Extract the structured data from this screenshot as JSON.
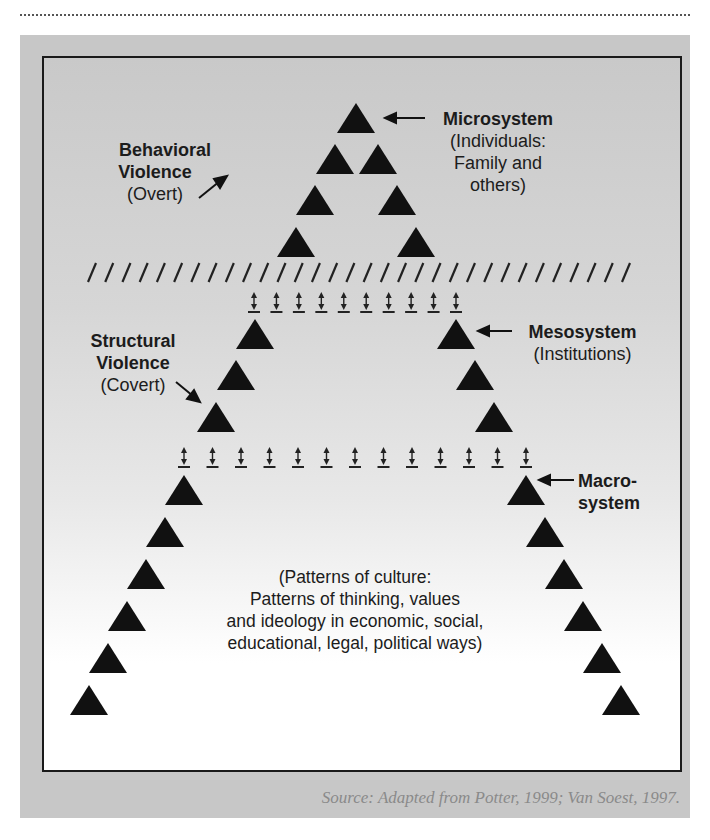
{
  "figure": {
    "labels": {
      "microsystem": {
        "title": "Microsystem",
        "lines": [
          "(Individuals:",
          "Family and",
          "others)"
        ]
      },
      "behavioral": {
        "title_1": "Behavioral",
        "title_2": "Violence",
        "sub": "(Overt)"
      },
      "mesosystem": {
        "title": "Mesosystem",
        "sub": "(Institutions)"
      },
      "structural": {
        "title_1": "Structural",
        "title_2": "Violence",
        "sub": "(Covert)"
      },
      "macrosystem": {
        "title_1": "Macro-",
        "title_2": "system"
      },
      "culture": {
        "lines": [
          "(Patterns of culture:",
          "Patterns of thinking, values",
          "and ideology in economic, social,",
          "educational, legal, political ways)"
        ]
      }
    },
    "source": "Source: Adapted from Potter, 1999; Van Soest, 1997.",
    "structure": {
      "micro_triangle_count": 7,
      "slash_divider_count": 32,
      "upper_double_arrow_count": 10,
      "meso_triangle_count": 6,
      "lower_double_arrow_count": 13,
      "macro_triangle_count": 12
    },
    "colors": {
      "ink": "#111111",
      "panel": "#c7c7c7",
      "source_text": "#8a8a8a"
    }
  }
}
